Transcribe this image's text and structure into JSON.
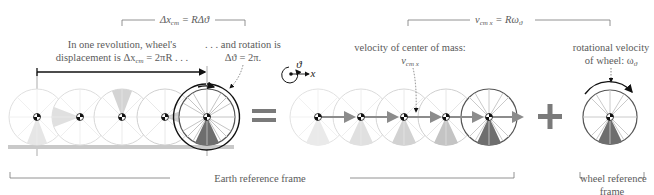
{
  "top_equations": {
    "left": {
      "prefix": "Δx",
      "sub": "cm",
      "rest": " = RΔϑ"
    },
    "right": {
      "prefix": "v",
      "sub": "cm x",
      "rest": " = Rω",
      "sub2": "ϑ"
    }
  },
  "annotations": {
    "revolution_line1": "In one revolution, wheel's",
    "revolution_line2_prefix": "displacement is Δx",
    "revolution_line2_sub": "cm",
    "revolution_line2_rest": " = 2πR . . .",
    "rotation_line1": ". . . and rotation is",
    "rotation_line2": "Δϑ = 2π.",
    "velocity_cm_label": "velocity of center of mass:",
    "velocity_cm_symbol": "v",
    "velocity_cm_symbol_sub": "cm x",
    "rotational_line1": "rotational velocity",
    "rotational_line2_prefix": "of wheel: ω",
    "rotational_line2_sub": "ϑ"
  },
  "axis_icon": {
    "theta": "ϑ",
    "x": "x"
  },
  "operators": {
    "equals": "=",
    "plus": "+"
  },
  "frames": {
    "earth": "Earth reference frame",
    "wheel_line1": "wheel reference",
    "wheel_line2": "frame"
  },
  "colors": {
    "light_wedge": "#e3e3e3",
    "mid_wedge": "#c8c8c8",
    "dark_wedge": "#6e6e6e",
    "light_rim": "#d8d8d8",
    "dark_rim": "#5a5a5a",
    "arrow": "#8c8c8c",
    "ground": "#c9c9c9",
    "operator": "#7a7a7a"
  }
}
